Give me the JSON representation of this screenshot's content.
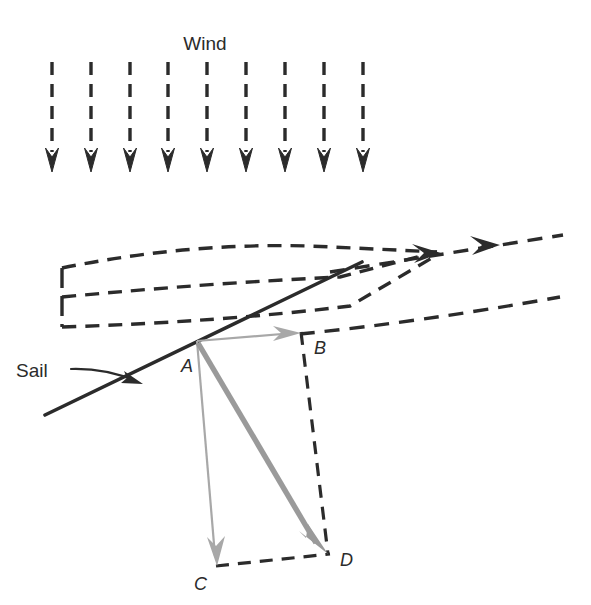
{
  "figure": {
    "title_label": "Wind",
    "sail_label": "Sail",
    "background_color": "#ffffff",
    "ink_color": "#2b2b2b",
    "vector_gray": "#9a9a9a",
    "vector_light_gray": "#a8a8a8"
  },
  "wind": {
    "label": "Wind",
    "arrow_count": 9,
    "direction": "downward",
    "style": "dashed-with-arrowhead",
    "x_positions": [
      52,
      91,
      130,
      168,
      207,
      246,
      285,
      324,
      363
    ],
    "y_top": 62,
    "y_bottom": 170
  },
  "hull": {
    "name": "boat-hull",
    "style": "dashed",
    "description": "dashed outline of boat hull pointing right toward the bow arrow"
  },
  "sail": {
    "label": "Sail",
    "style": "solid",
    "x1": 45,
    "y1": 415,
    "x2": 362,
    "y2": 262,
    "pointer_from_x": 72,
    "pointer_from_y": 369,
    "pointer_to_x": 140,
    "pointer_to_y": 383
  },
  "bow_arrow": {
    "name": "boat-heading-arrow",
    "style": "dashed-with-arrowheads",
    "arrowhead_count": 2
  },
  "vectors": {
    "origin_label": "A",
    "points": [
      {
        "id": "A",
        "label": "A",
        "x": 197,
        "y": 341,
        "label_x": 181,
        "label_y": 372
      },
      {
        "id": "B",
        "label": "B",
        "x": 301,
        "y": 332,
        "label_x": 314,
        "label_y": 354
      },
      {
        "id": "C",
        "label": "C",
        "x": 216,
        "y": 565,
        "label_x": 194,
        "label_y": 590
      },
      {
        "id": "D",
        "label": "D",
        "x": 326,
        "y": 552,
        "label_x": 340,
        "label_y": 566
      }
    ],
    "arrows": [
      {
        "name": "vector-a-to-b",
        "from": "A",
        "to": "B",
        "weight": "thin",
        "color": "#a8a8a8"
      },
      {
        "name": "vector-a-to-c",
        "from": "A",
        "to": "C",
        "weight": "thin",
        "color": "#a8a8a8"
      },
      {
        "name": "vector-a-to-d",
        "from": "A",
        "to": "D",
        "weight": "thick",
        "color": "#9a9a9a"
      }
    ],
    "construction_lines": [
      {
        "name": "dashed-b-to-d",
        "from": "B",
        "to": "D",
        "style": "dashed"
      },
      {
        "name": "dashed-c-to-d",
        "from": "C",
        "to": "D",
        "style": "dashed"
      }
    ]
  }
}
